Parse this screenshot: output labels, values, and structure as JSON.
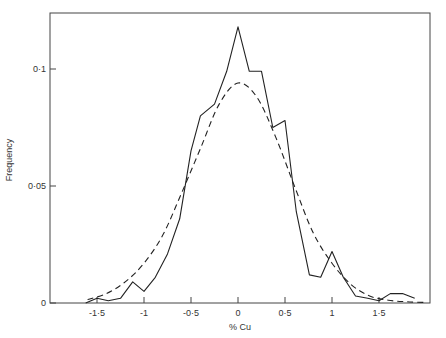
{
  "chart_data": {
    "type": "line",
    "title": "",
    "xlabel": "% Cu",
    "ylabel": "Frequency",
    "xlim": [
      -2.0,
      2.0
    ],
    "ylim": [
      0,
      0.124
    ],
    "grid": false,
    "legend": null,
    "x_ticks": [
      -1.5,
      -1,
      -0.5,
      0,
      0.5,
      1,
      1.5
    ],
    "x_tick_labels": [
      "-1·5",
      "-1",
      "-0·5",
      "0",
      "0·5",
      "1",
      "1·5"
    ],
    "y_ticks": [
      0,
      0.05,
      0.1
    ],
    "y_tick_labels": [
      "0",
      "0·05",
      "0·1"
    ],
    "series": [
      {
        "name": "Observed frequency",
        "style": "solid",
        "x": [
          -1.62,
          -1.5,
          -1.38,
          -1.25,
          -1.12,
          -1.0,
          -0.88,
          -0.75,
          -0.62,
          -0.5,
          -0.4,
          -0.25,
          -0.12,
          0.0,
          0.12,
          0.25,
          0.37,
          0.5,
          0.62,
          0.76,
          0.88,
          1.0,
          1.12,
          1.25,
          1.38,
          1.5,
          1.62,
          1.75,
          1.88
        ],
        "values": [
          0.0,
          0.002,
          0.001,
          0.002,
          0.009,
          0.005,
          0.011,
          0.021,
          0.036,
          0.065,
          0.08,
          0.085,
          0.099,
          0.118,
          0.099,
          0.099,
          0.075,
          0.078,
          0.039,
          0.012,
          0.011,
          0.022,
          0.011,
          0.003,
          0.002,
          0.001,
          0.004,
          0.004,
          0.002
        ]
      },
      {
        "name": "Normal fit",
        "style": "dashed",
        "x": [
          -1.6,
          -1.4,
          -1.2,
          -1.0,
          -0.8,
          -0.6,
          -0.4,
          -0.2,
          0.0,
          0.2,
          0.4,
          0.6,
          0.8,
          1.0,
          1.2,
          1.4,
          1.6,
          1.8,
          2.0
        ],
        "values": [
          0.0015,
          0.004,
          0.009,
          0.017,
          0.029,
          0.047,
          0.066,
          0.085,
          0.094,
          0.088,
          0.071,
          0.05,
          0.03,
          0.017,
          0.008,
          0.003,
          0.0012,
          0.0005,
          0.0002
        ]
      }
    ]
  }
}
